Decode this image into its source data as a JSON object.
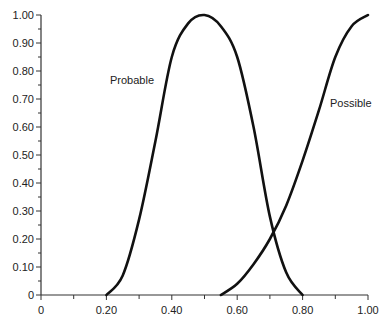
{
  "chart_data": {
    "type": "line",
    "title": "",
    "xlabel": "",
    "ylabel": "",
    "xlim": [
      0,
      1.0
    ],
    "ylim": [
      0,
      1.0
    ],
    "grid": false,
    "legend": "inline labels",
    "x_ticks": [
      "0",
      "0.20",
      "0.40",
      "0.60",
      "0.80",
      "1.00"
    ],
    "y_ticks": [
      "0",
      "0.10",
      "0.20",
      "0.30",
      "0.40",
      "0.50",
      "0.60",
      "0.70",
      "0.80",
      "0.90",
      "1.00"
    ],
    "series": [
      {
        "name": "Probable",
        "x": [
          0.2,
          0.25,
          0.3,
          0.35,
          0.4,
          0.45,
          0.5,
          0.55,
          0.6,
          0.65,
          0.7,
          0.75,
          0.8
        ],
        "y": [
          0.0,
          0.07,
          0.27,
          0.55,
          0.85,
          0.97,
          1.0,
          0.96,
          0.85,
          0.6,
          0.28,
          0.08,
          0.0
        ],
        "label_pos": [
          0.28,
          0.77
        ]
      },
      {
        "name": "Possible",
        "x": [
          0.55,
          0.6,
          0.65,
          0.7,
          0.75,
          0.8,
          0.85,
          0.9,
          0.95,
          1.0
        ],
        "y": [
          0.0,
          0.04,
          0.11,
          0.2,
          0.32,
          0.48,
          0.66,
          0.85,
          0.96,
          1.0
        ],
        "label_pos": [
          0.87,
          0.77
        ]
      }
    ]
  },
  "labels": {
    "probable": "Probable",
    "possible": "Possible"
  }
}
